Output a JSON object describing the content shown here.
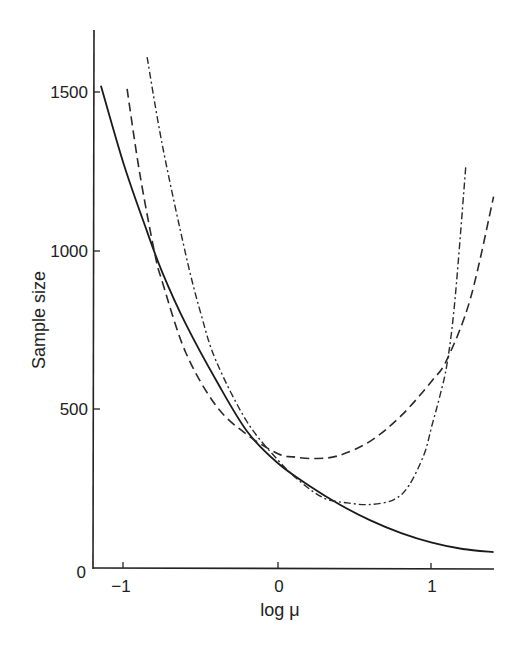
{
  "chart_data": {
    "type": "line",
    "title": "",
    "xlabel": "log μ",
    "ylabel": "Sample size",
    "xlim": [
      -1.2,
      1.4
    ],
    "ylim": [
      0,
      1700
    ],
    "grid": false,
    "legend": null,
    "xticks": [
      -1,
      0,
      1
    ],
    "xtick_labels": [
      "−1",
      "0",
      "1"
    ],
    "yticks": [
      0,
      500,
      1000,
      1500
    ],
    "ytick_labels": [
      "0",
      "500",
      "1000",
      "1500"
    ],
    "series": [
      {
        "name": "solid",
        "style": "solid",
        "x": [
          -1.15,
          -1.0,
          -0.85,
          -0.75,
          -0.6,
          -0.4,
          -0.2,
          0.0,
          0.2,
          0.4,
          0.6,
          0.8,
          1.0,
          1.2,
          1.4
        ],
        "y": [
          1520,
          1270,
          1060,
          930,
          770,
          590,
          430,
          330,
          260,
          200,
          150,
          110,
          80,
          60,
          50
        ]
      },
      {
        "name": "dashed",
        "style": "dashed",
        "x": [
          -0.98,
          -0.9,
          -0.8,
          -0.75,
          -0.6,
          -0.4,
          -0.2,
          0.0,
          0.1,
          0.25,
          0.4,
          0.6,
          0.8,
          1.0,
          1.1,
          1.25,
          1.4
        ],
        "y": [
          1510,
          1250,
          990,
          900,
          680,
          510,
          420,
          360,
          350,
          345,
          355,
          400,
          480,
          590,
          660,
          850,
          1170
        ]
      },
      {
        "name": "dash-dot",
        "style": "dash-dot",
        "x": [
          -0.85,
          -0.75,
          -0.6,
          -0.5,
          -0.4,
          -0.2,
          0.0,
          0.15,
          0.3,
          0.45,
          0.6,
          0.75,
          0.85,
          0.95,
          1.0,
          1.05,
          1.1,
          1.15,
          1.22
        ],
        "y": [
          1610,
          1330,
          990,
          800,
          650,
          460,
          340,
          270,
          220,
          205,
          200,
          215,
          260,
          360,
          450,
          540,
          650,
          850,
          1270
        ]
      }
    ]
  }
}
